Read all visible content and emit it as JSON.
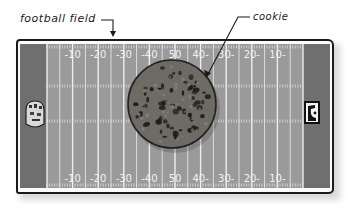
{
  "labels": {
    "field": "football field",
    "cookie": "cookie"
  },
  "field": {
    "yard_numbers_top": [
      "-10",
      "-20",
      "-30",
      "-40",
      "50",
      "40-",
      "30-",
      "20-",
      "10-"
    ],
    "yard_numbers_bottom": [
      "-10",
      "-20",
      "-30",
      "-40",
      "50",
      "40-",
      "30-",
      "20-",
      "10-"
    ],
    "yard_line_count": 21,
    "colors": {
      "turf": "#9a9a9a",
      "endzone": "#6f6f6f",
      "lines": "#f2f2f2",
      "outline": "#1a1a1a"
    }
  },
  "cookie": {
    "colors": {
      "dough": "#6e6a64",
      "chips": "#1e1e1e",
      "edge": "#222222"
    }
  },
  "endzone_logos": {
    "left": "team-crest-icon",
    "right": "team-logo-icon"
  }
}
